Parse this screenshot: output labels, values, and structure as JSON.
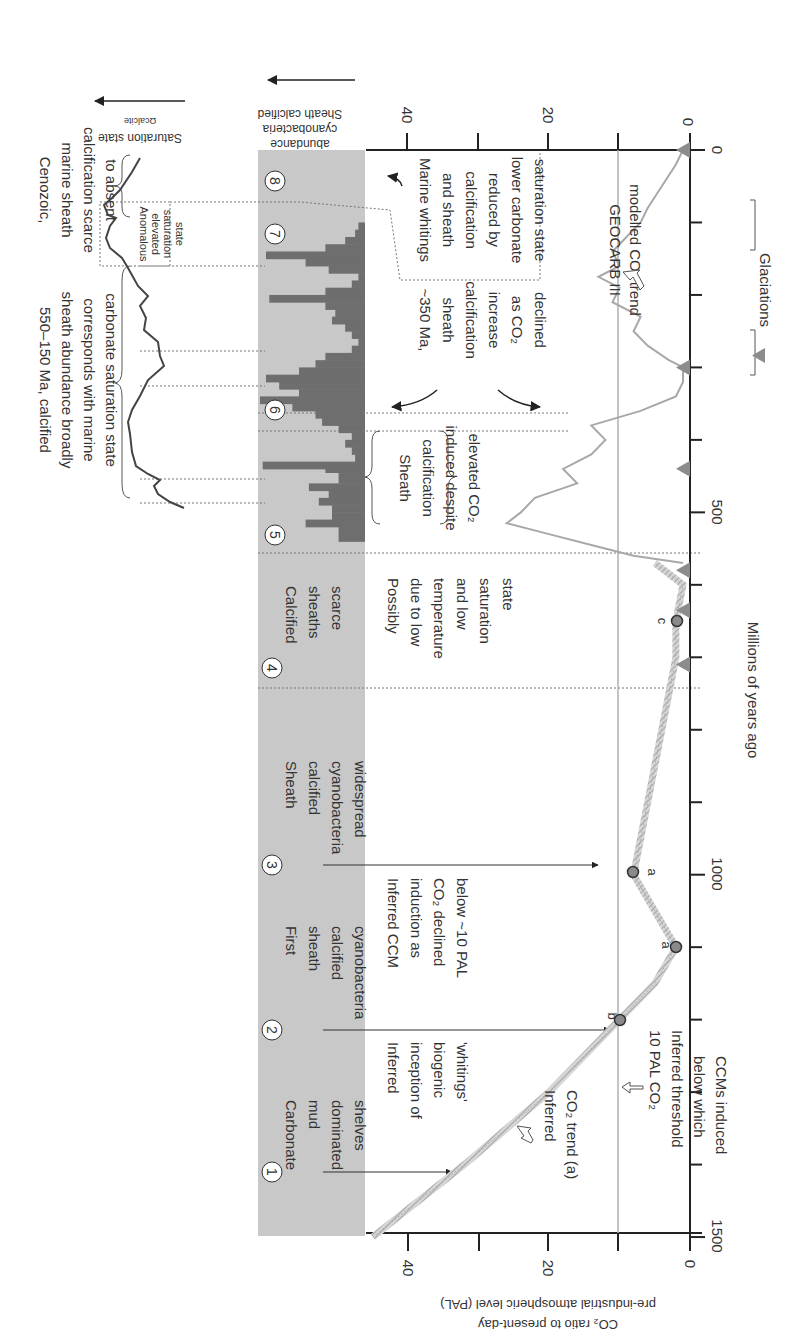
{
  "chart_data": {
    "type": "line",
    "orientation": "figure rotated 90 degrees clockwise; time axis vertical (0 Ma top, 1500 Ma bottom)",
    "title": "",
    "xlabel": "Millions of years ago",
    "ylabel": "CO2 ratio to present-day pre-industrial atmospheric level (PAL)",
    "x_ticks": [
      0,
      500,
      1000,
      1500
    ],
    "x_range": [
      0,
      1500
    ],
    "y_ticks": [
      0,
      20,
      40
    ],
    "y_range": [
      0,
      45
    ],
    "threshold": {
      "value": 10,
      "label_lines": [
        "10 PAL CO₂",
        "Inferred threshold",
        "below which",
        "CCMs induced"
      ]
    },
    "series": [
      {
        "name": "GEOCARB III modelled CO2 trend",
        "style": "solid light gray",
        "x": [
          0,
          20,
          50,
          80,
          100,
          120,
          140,
          160,
          175,
          190,
          210,
          230,
          250,
          270,
          290,
          300,
          320,
          340,
          360,
          380,
          400,
          420,
          440,
          460,
          480,
          500,
          515,
          530,
          545,
          560,
          570
        ],
        "y": [
          1,
          2,
          4,
          6,
          7,
          9,
          11,
          10,
          13,
          10,
          11,
          7,
          8,
          6,
          3,
          1,
          1,
          2,
          7,
          14,
          12,
          14,
          18,
          16,
          22,
          24,
          26,
          20,
          14,
          8,
          1
        ]
      },
      {
        "name": "Inferred CO2 trend (a)",
        "style": "hatched dashed gray band",
        "x": [
          1500,
          1400,
          1300,
          1200,
          1150,
          1100,
          1050,
          1000,
          900,
          800,
          700,
          650,
          600,
          570
        ],
        "y": [
          45,
          32,
          20,
          10,
          5,
          2,
          5,
          8,
          6,
          4,
          2,
          2,
          1,
          5
        ]
      }
    ],
    "points": [
      {
        "label": "b",
        "x": 1200,
        "y": 10
      },
      {
        "label": "a",
        "x": 1100,
        "y": 2
      },
      {
        "label": "a",
        "x": 1000,
        "y": 8
      },
      {
        "label": "c",
        "x": 650,
        "y": 2
      }
    ],
    "glaciations_ma": [
      0,
      300,
      440,
      580,
      635,
      710
    ],
    "legend": [
      "Glaciations"
    ],
    "upper_panel": {
      "name": "Sheath calcified cyanobacteria abundance",
      "axis_ticks": [
        0,
        20,
        40
      ],
      "bars_ma_to_value": [
        [
          540,
          8
        ],
        [
          525,
          8
        ],
        [
          520,
          18
        ],
        [
          510,
          10
        ],
        [
          500,
          10
        ],
        [
          490,
          14
        ],
        [
          480,
          11
        ],
        [
          470,
          17
        ],
        [
          460,
          8
        ],
        [
          445,
          12
        ],
        [
          440,
          31
        ],
        [
          430,
          3
        ],
        [
          420,
          4
        ],
        [
          410,
          6
        ],
        [
          400,
          4
        ],
        [
          390,
          8
        ],
        [
          380,
          13
        ],
        [
          370,
          15
        ],
        [
          360,
          22
        ],
        [
          350,
          32
        ],
        [
          340,
          20
        ],
        [
          330,
          26
        ],
        [
          320,
          30
        ],
        [
          310,
          20
        ],
        [
          300,
          15
        ],
        [
          290,
          12
        ],
        [
          280,
          4
        ],
        [
          270,
          2
        ],
        [
          260,
          4
        ],
        [
          250,
          6
        ],
        [
          240,
          10
        ],
        [
          230,
          9
        ],
        [
          220,
          12
        ],
        [
          210,
          29
        ],
        [
          200,
          12
        ],
        [
          190,
          4
        ],
        [
          180,
          2
        ],
        [
          170,
          11
        ],
        [
          160,
          18
        ],
        [
          150,
          30
        ],
        [
          140,
          12
        ],
        [
          130,
          6
        ],
        [
          120,
          3
        ],
        [
          110,
          2
        ],
        [
          100,
          0
        ]
      ]
    },
    "saturation_panel": {
      "name": "Ωcalcite Saturation state",
      "arrow": "increasing"
    }
  },
  "labels": {
    "axis_time": "Millions of years ago",
    "tick_0": "0",
    "tick_500": "500",
    "tick_1000": "1000",
    "tick_1500": "1500",
    "co2_ticks": [
      "0",
      "20",
      "40"
    ],
    "abund_ticks": [
      "0",
      "20",
      "40"
    ],
    "co2_axis_line1": "CO₂ ratio to present-day",
    "co2_axis_line2": "pre-industrial atmospheric level (PAL)",
    "abund_axis_line1": "Sheath calcified",
    "abund_axis_line2": "cyanobacteria",
    "abund_axis_line3": "abundance",
    "sat_axis_symbol": "Ωcalcite",
    "sat_axis_label": "Saturation state",
    "glaciations": "Glaciations",
    "geocarb_1": "GEOCARB III",
    "geocarb_2": "modelled CO₂ trend",
    "inferred_trend_1": "Inferred",
    "inferred_trend_2": "CO₂ trend (a)",
    "threshold_1": "10 PAL CO₂",
    "threshold_2": "Inferred threshold",
    "threshold_3": "below which",
    "threshold_4": "CCMs induced",
    "pt_b": "b",
    "pt_a1": "a",
    "pt_a2": "a",
    "pt_c": "c"
  },
  "stages": [
    {
      "num": "1",
      "lines": [
        "Carbonate",
        "mud",
        "dominated",
        "shelves"
      ]
    },
    {
      "num": "2",
      "lines": [
        "First",
        "sheath",
        "calcified",
        "cyanobacteria"
      ]
    },
    {
      "num": "3",
      "lines": [
        "Sheath",
        "calcified",
        "cyanobacteria",
        "widespread"
      ]
    },
    {
      "num": "4",
      "lines": [
        "Calcified",
        "sheaths",
        "scarce"
      ]
    },
    {
      "num": "5"
    },
    {
      "num": "6"
    },
    {
      "num": "7"
    },
    {
      "num": "8"
    }
  ],
  "notes": {
    "whitings": [
      "Inferred",
      "inception of",
      "biogenic",
      "'whitings'"
    ],
    "ccm": [
      "Inferred CCM",
      "induction as",
      "CO₂ declined",
      "below ~10 PAL"
    ],
    "low_temp": [
      "Possibly",
      "due to low",
      "temperature",
      "and low",
      "saturation",
      "state"
    ],
    "elevated": [
      "Sheath",
      "calcification",
      "induced despite",
      "elevated CO₂"
    ],
    "ma350": [
      "~350 Ma,",
      "sheath",
      "calcification",
      "increase",
      "as CO₂",
      "declined"
    ],
    "marine_whitings": [
      "Marine whitings",
      "and sheath",
      "calcification",
      "reduced by",
      "lower carbonate",
      "saturation state"
    ],
    "anomalous": [
      "Anomalous",
      "elevated",
      "saturation",
      "state"
    ],
    "ma550_150": [
      "550–150 Ma, calcified",
      "sheath abundance broadly",
      "corresponds with marine",
      "carbonate saturation state"
    ],
    "cenozoic": [
      "Cenozoic,",
      "marine sheath",
      "calcification scarce",
      "to absent"
    ]
  },
  "colors": {
    "band": "#c8c8c8",
    "bars": "#6e6e6e",
    "axis": "#222222",
    "geocarb": "#a8a8a8",
    "inferred": "#b8b8b8",
    "threshold": "#b0b0b0",
    "point": "#8a8a8a",
    "glacier": "#8c8c8c"
  }
}
